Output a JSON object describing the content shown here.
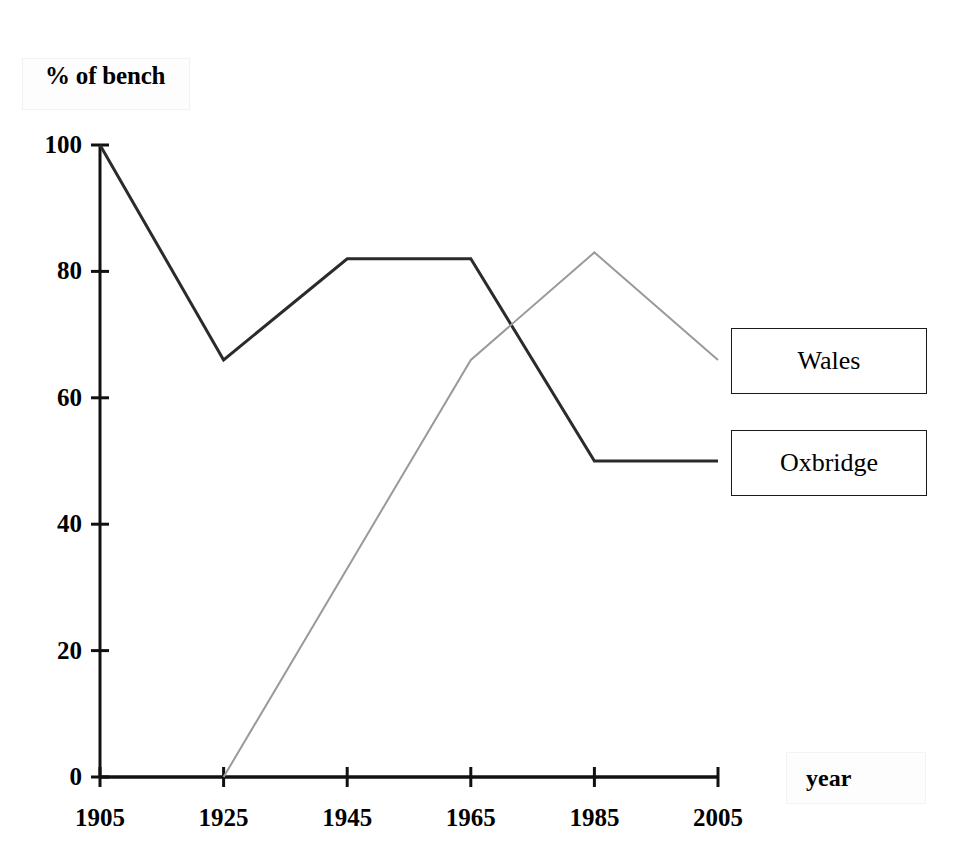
{
  "chart_data": {
    "type": "line",
    "title": "",
    "xlabel": "year",
    "ylabel": "% of bench",
    "x": [
      1905,
      1925,
      1945,
      1965,
      1985,
      2005
    ],
    "xlim": [
      1905,
      2005
    ],
    "ylim": [
      0,
      100
    ],
    "yticks": [
      0,
      20,
      40,
      60,
      80,
      100
    ],
    "xticks": [
      "1905",
      "1925",
      "1945",
      "1965",
      "1985",
      "2005"
    ],
    "ytick_labels": [
      "0",
      "20",
      "40",
      "60",
      "80",
      "100"
    ],
    "grid": false,
    "legend_position": "right",
    "series": [
      {
        "name": "Oxbridge",
        "color": "#2b2b2b",
        "x": [
          1905,
          1925,
          1945,
          1965,
          1985,
          2005
        ],
        "values": [
          100,
          66,
          82,
          82,
          50,
          50
        ]
      },
      {
        "name": "Wales",
        "color": "#9a9a9a",
        "x": [
          1925,
          1965,
          1985,
          2005
        ],
        "values": [
          0,
          66,
          83,
          66
        ]
      }
    ]
  },
  "axes": {
    "y_title": "% of bench",
    "x_title": "year",
    "y_tick_labels": [
      "100",
      "80",
      "60",
      "40",
      "20",
      "0"
    ],
    "x_tick_labels": [
      "1905",
      "1925",
      "1945",
      "1965",
      "1985",
      "2005"
    ]
  },
  "legend": {
    "items": [
      {
        "label": "Wales"
      },
      {
        "label": "Oxbridge"
      }
    ]
  }
}
